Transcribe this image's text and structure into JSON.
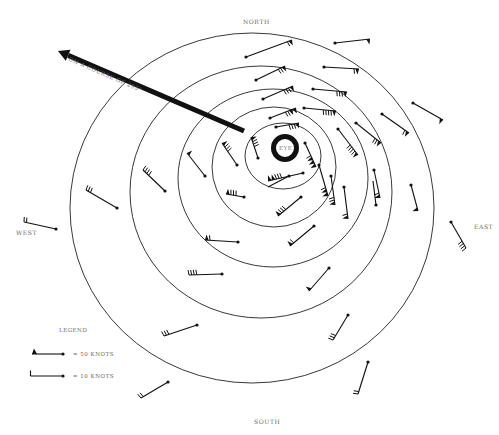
{
  "diagram": {
    "compass": {
      "north": "NORTH",
      "south": "SOUTH",
      "east": "EAST",
      "west": "WEST"
    },
    "eye_label": "EYE",
    "course_label": "ON A COURSE OF 295°",
    "legend": {
      "title": "LEGEND",
      "items": [
        {
          "symbol": "pennant",
          "label": "= 50 KNOTS"
        },
        {
          "symbol": "barb",
          "label": "= 10 KNOTS"
        }
      ]
    },
    "colors": {
      "ink": "#111111",
      "label": "#6a6a6a",
      "background": "#ffffff"
    },
    "rings": [
      {
        "cx": 252,
        "cy": 208,
        "rx": 182,
        "ry": 175
      },
      {
        "cx": 261,
        "cy": 192,
        "rx": 131,
        "ry": 126
      },
      {
        "cx": 273,
        "cy": 178,
        "rx": 95,
        "ry": 89
      },
      {
        "cx": 274,
        "cy": 167,
        "rx": 62,
        "ry": 60
      },
      {
        "cx": 283,
        "cy": 156,
        "rx": 38,
        "ry": 33
      }
    ],
    "eye": {
      "cx": 285,
      "cy": 148,
      "r": 11.5,
      "stroke": 5
    },
    "course_arrow": {
      "x1": 244,
      "y1": 131,
      "x2": 58,
      "y2": 51
    },
    "barbs": [
      {
        "x": 246,
        "y": 57,
        "tx": 292,
        "ty": 40,
        "flags": 1,
        "barbs": 1
      },
      {
        "x": 335,
        "y": 43,
        "tx": 370,
        "ty": 39,
        "flags": 1,
        "barbs": 0
      },
      {
        "x": 256,
        "y": 80,
        "tx": 285,
        "ty": 66,
        "flags": 1,
        "barbs": 2
      },
      {
        "x": 324,
        "y": 67,
        "tx": 359,
        "ty": 69,
        "flags": 1,
        "barbs": 1
      },
      {
        "x": 263,
        "y": 99,
        "tx": 293,
        "ty": 86,
        "flags": 1,
        "barbs": 3
      },
      {
        "x": 313,
        "y": 89,
        "tx": 347,
        "ty": 92,
        "flags": 1,
        "barbs": 3
      },
      {
        "x": 270,
        "y": 118,
        "tx": 296,
        "ty": 108,
        "flags": 2,
        "barbs": 2
      },
      {
        "x": 304,
        "y": 108,
        "tx": 336,
        "ty": 111,
        "flags": 1,
        "barbs": 4
      },
      {
        "x": 276,
        "y": 127,
        "tx": 299,
        "ty": 123,
        "flags": 1,
        "barbs": 3
      },
      {
        "x": 413,
        "y": 103,
        "tx": 443,
        "ty": 120,
        "flags": 1,
        "barbs": 0
      },
      {
        "x": 382,
        "y": 114,
        "tx": 409,
        "ty": 133,
        "flags": 1,
        "barbs": 1
      },
      {
        "x": 356,
        "y": 123,
        "tx": 381,
        "ty": 143,
        "flags": 1,
        "barbs": 2
      },
      {
        "x": 338,
        "y": 129,
        "tx": 358,
        "ty": 155,
        "flags": 1,
        "barbs": 4
      },
      {
        "x": 258,
        "y": 158,
        "tx": 251,
        "ty": 137,
        "flags": 1,
        "barbs": 3
      },
      {
        "x": 237,
        "y": 165,
        "tx": 222,
        "ty": 143,
        "flags": 1,
        "barbs": 3
      },
      {
        "x": 205,
        "y": 176,
        "tx": 187,
        "ty": 153,
        "flags": 1,
        "barbs": 0
      },
      {
        "x": 165,
        "y": 191,
        "tx": 143,
        "ty": 170,
        "flags": 0,
        "barbs": 4
      },
      {
        "x": 117,
        "y": 208,
        "tx": 86,
        "ty": 190,
        "flags": 0,
        "barbs": 3
      },
      {
        "x": 305,
        "y": 143,
        "tx": 316,
        "ty": 167,
        "flags": 3,
        "barbs": 1
      },
      {
        "x": 303,
        "y": 173,
        "tx": 268,
        "ty": 181,
        "flags": 2,
        "barbs": 3
      },
      {
        "x": 319,
        "y": 165,
        "tx": 328,
        "ty": 196,
        "flags": 2,
        "barbs": 1
      },
      {
        "x": 331,
        "y": 176,
        "tx": 335,
        "ty": 205,
        "flags": 1,
        "barbs": 2
      },
      {
        "x": 344,
        "y": 187,
        "tx": 348,
        "ty": 219,
        "flags": 1,
        "barbs": 1
      },
      {
        "x": 289,
        "y": 176,
        "tx": 268,
        "ty": 187,
        "flags": 0,
        "barbs": 0
      },
      {
        "x": 301,
        "y": 197,
        "tx": 278,
        "ty": 216,
        "flags": 1,
        "barbs": 3
      },
      {
        "x": 314,
        "y": 226,
        "tx": 290,
        "ty": 246,
        "flags": 1,
        "barbs": 1
      },
      {
        "x": 244,
        "y": 197,
        "tx": 226,
        "ty": 194,
        "flags": 1,
        "barbs": 3
      },
      {
        "x": 238,
        "y": 242,
        "tx": 205,
        "ty": 240,
        "flags": 1,
        "barbs": 1
      },
      {
        "x": 222,
        "y": 274,
        "tx": 189,
        "ty": 275,
        "flags": 0,
        "barbs": 4
      },
      {
        "x": 329,
        "y": 268,
        "tx": 309,
        "ty": 291,
        "flags": 1,
        "barbs": 0
      },
      {
        "x": 348,
        "y": 315,
        "tx": 333,
        "ty": 340,
        "flags": 0,
        "barbs": 3
      },
      {
        "x": 197,
        "y": 325,
        "tx": 164,
        "ty": 336,
        "flags": 0,
        "barbs": 3
      },
      {
        "x": 368,
        "y": 362,
        "tx": 358,
        "ty": 394,
        "flags": 0,
        "barbs": 2
      },
      {
        "x": 168,
        "y": 382,
        "tx": 141,
        "ty": 398,
        "flags": 0,
        "barbs": 2
      },
      {
        "x": 376,
        "y": 205,
        "tx": 373,
        "ty": 181,
        "flags": 0,
        "barbs": 0
      },
      {
        "x": 374,
        "y": 170,
        "tx": 380,
        "ty": 198,
        "flags": 1,
        "barbs": 1
      },
      {
        "x": 411,
        "y": 185,
        "tx": 418,
        "ty": 211,
        "flags": 1,
        "barbs": 0
      },
      {
        "x": 451,
        "y": 222,
        "tx": 466,
        "ty": 248,
        "flags": 0,
        "barbs": 4
      },
      {
        "x": 56,
        "y": 229,
        "tx": 24,
        "ty": 222,
        "flags": 0,
        "barbs": 2
      }
    ]
  }
}
